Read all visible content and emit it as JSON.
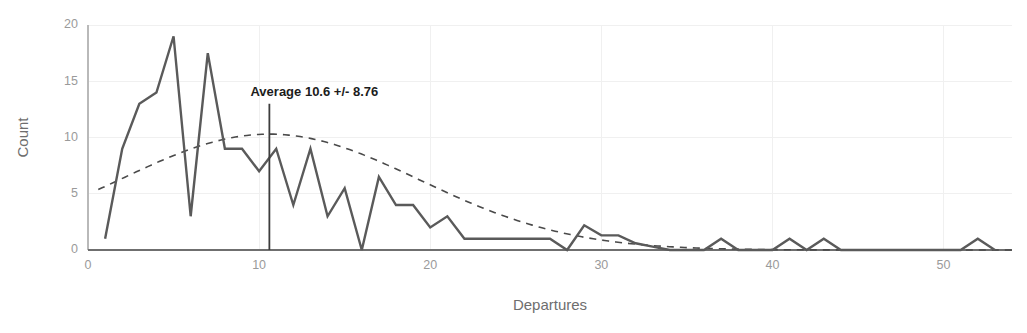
{
  "chart_data": {
    "type": "line",
    "title": "",
    "subtitle": "",
    "xlabel": "Departures",
    "ylabel": "Count",
    "xlim": [
      0,
      54
    ],
    "ylim": [
      0,
      20
    ],
    "xticks": [
      0,
      10,
      20,
      30,
      40,
      50
    ],
    "yticks": [
      0,
      5,
      10,
      15,
      20
    ],
    "grid": true,
    "legend": "none",
    "series": [
      {
        "name": "Count",
        "kind": "frequency-polygon",
        "x": [
          1,
          2,
          3,
          4,
          5,
          6,
          7,
          8,
          9,
          10,
          11,
          12,
          13,
          14,
          15,
          16,
          17,
          18,
          19,
          20,
          21,
          22,
          23,
          24,
          25,
          26,
          27,
          28,
          29,
          30,
          31,
          32,
          33,
          34,
          35,
          36,
          37,
          38,
          39,
          40,
          41,
          42,
          43,
          44,
          45,
          46,
          47,
          48,
          49,
          50,
          51,
          52,
          53
        ],
        "values": [
          1,
          9,
          13,
          14,
          19,
          3,
          17.5,
          9,
          9,
          7,
          9,
          4,
          9,
          3,
          5.5,
          0,
          6.5,
          4,
          4,
          2,
          3,
          1,
          1,
          1,
          1,
          1,
          1,
          0,
          2.2,
          1.3,
          1.3,
          0.6,
          0.3,
          0,
          0,
          0,
          1,
          0,
          0,
          0,
          1,
          0,
          1,
          0,
          0,
          0,
          0,
          0,
          0,
          0,
          0,
          1,
          0
        ]
      },
      {
        "name": "Normal fit",
        "kind": "dashed-normal-curve",
        "mean": 10.6,
        "sd": 8.76,
        "peak_value": 10.3
      }
    ],
    "annotations": [
      {
        "name": "average-annotation",
        "text": "Average 10.6 +/- 8.76",
        "x": 10.6,
        "marker_line_top": 13,
        "marker_line_bottom": 0
      }
    ],
    "colors": {
      "data_line": "#5a5a5a",
      "fit_line": "#4a4a4a",
      "grid": "#f0f0f0",
      "axis": "#b9b9b9",
      "tick_text": "#9a9a9a",
      "axis_title": "#6e6e6e",
      "annotation_text": "#1c1c1c",
      "background": "#ffffff"
    }
  }
}
